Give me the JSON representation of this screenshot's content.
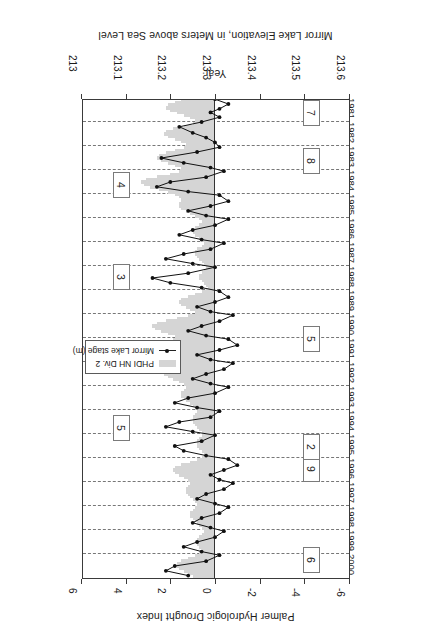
{
  "chart_data": {
    "type": "bar",
    "title": "",
    "orientation": "horizontal-time",
    "xlabel": "Palmer Hydrologic Drought Index",
    "ylabel": "Year",
    "secondary_xlabel": "Mirror Lake Elevation, in Meters above Sea Level",
    "xlim": [
      -6,
      6
    ],
    "xticks": [
      "6",
      "4",
      "2",
      "0",
      "-2",
      "-4",
      "-6"
    ],
    "xtick_values": [
      6,
      4,
      2,
      0,
      -2,
      -4,
      -6
    ],
    "secondary_xlim": [
      213.6,
      213.0
    ],
    "secondary_xticks": [
      "213.6",
      "213.5",
      "213.4",
      "213.3",
      "213.2",
      "213.1",
      "213"
    ],
    "secondary_xtick_values": [
      213.6,
      213.5,
      213.4,
      213.3,
      213.2,
      213.1,
      213.0
    ],
    "ylim": [
      1981,
      2000
    ],
    "yticks": [
      "1981",
      "1982",
      "1983",
      "1984",
      "1985",
      "1986",
      "1987",
      "1988",
      "1989",
      "1990",
      "1991",
      "1992",
      "1993",
      "1994",
      "1995",
      "1996",
      "1997",
      "1998",
      "1999",
      "2000"
    ],
    "grid": true,
    "legend_position": "center-left",
    "legend": [
      {
        "name": "PHDI NH Div. 2",
        "marker": "bar",
        "color": "#d5d5d5"
      },
      {
        "name": "Mirror Lake stage (m)",
        "marker": "line-dot",
        "color": "#111111"
      }
    ],
    "series": [
      {
        "name": "PHDI NH Div. 2",
        "type": "bar",
        "color": "#d5d5d5",
        "x": [
          1981.0,
          1981.1,
          1981.2,
          1981.3,
          1981.4,
          1981.5,
          1981.6,
          1981.7,
          1981.8,
          1981.9,
          1982.0,
          1982.1,
          1982.2,
          1982.3,
          1982.4,
          1982.5,
          1982.6,
          1982.7,
          1982.8,
          1982.9,
          1983.0,
          1983.1,
          1983.2,
          1983.3,
          1983.4,
          1983.5,
          1983.6,
          1983.7,
          1983.8,
          1983.9,
          1984.0,
          1984.1,
          1984.2,
          1984.3,
          1984.4,
          1984.5,
          1984.6,
          1984.7,
          1984.8,
          1984.9,
          1985.0,
          1985.1,
          1985.2,
          1985.3,
          1985.4,
          1985.5,
          1985.6,
          1985.7,
          1985.8,
          1985.9,
          1986.0,
          1986.1,
          1986.2,
          1986.3,
          1986.4,
          1986.5,
          1986.6,
          1986.7,
          1986.8,
          1986.9,
          1987.0,
          1987.1,
          1987.2,
          1987.3,
          1987.4,
          1987.5,
          1987.6,
          1987.7,
          1987.8,
          1987.9,
          1988.0,
          1988.1,
          1988.2,
          1988.3,
          1988.4,
          1988.5,
          1988.6,
          1988.7,
          1988.8,
          1988.9,
          1989.0,
          1989.1,
          1989.2,
          1989.3,
          1989.4,
          1989.5,
          1989.6,
          1989.7,
          1989.8,
          1989.9,
          1990.0,
          1990.1,
          1990.2,
          1990.3,
          1990.4,
          1990.5,
          1990.6,
          1990.7,
          1990.8,
          1990.9,
          1991.0,
          1991.1,
          1991.2,
          1991.3,
          1991.4,
          1991.5,
          1991.6,
          1991.7,
          1991.8,
          1991.9,
          1992.0,
          1992.1,
          1992.2,
          1992.3,
          1992.4,
          1992.5,
          1992.6,
          1992.7,
          1992.8,
          1992.9,
          1993.0,
          1993.1,
          1993.2,
          1993.3,
          1993.4,
          1993.5,
          1993.6,
          1993.7,
          1993.8,
          1993.9,
          1994.0,
          1994.1,
          1994.2,
          1994.3,
          1994.4,
          1994.5,
          1994.6,
          1994.7,
          1994.8,
          1994.9,
          1995.0,
          1995.1,
          1995.2,
          1995.3,
          1995.4,
          1995.5,
          1995.6,
          1995.7,
          1995.8,
          1995.9,
          1996.0,
          1996.1,
          1996.2,
          1996.3,
          1996.4,
          1996.5,
          1996.6,
          1996.7,
          1996.8,
          1996.9,
          1997.0,
          1997.1,
          1997.2,
          1997.3,
          1997.4,
          1997.5,
          1997.6,
          1997.7,
          1997.8,
          1997.9,
          1998.0,
          1998.1,
          1998.2,
          1998.3,
          1998.4,
          1998.5,
          1998.6,
          1998.7,
          1998.8,
          1998.9,
          1999.0,
          1999.1,
          1999.2,
          1999.3,
          1999.4,
          1999.5,
          1999.6,
          1999.7,
          1999.8,
          1999.9,
          2000.0,
          2000.1,
          2000.2,
          2000.3,
          2000.4,
          2000.5,
          2000.6,
          2000.7,
          2000.8,
          2000.9
        ],
        "values": [
          1.3,
          1.5,
          1.8,
          2.1,
          2.2,
          2.0,
          1.7,
          1.4,
          1.1,
          0.9,
          0.8,
          1.0,
          1.4,
          1.9,
          2.2,
          2.3,
          2.1,
          1.8,
          1.5,
          1.3,
          1.2,
          1.4,
          1.8,
          2.2,
          2.5,
          2.6,
          2.4,
          2.1,
          1.8,
          1.5,
          1.4,
          1.6,
          2.0,
          2.6,
          3.1,
          3.3,
          3.2,
          2.9,
          2.5,
          2.1,
          1.8,
          1.6,
          1.5,
          1.5,
          1.6,
          1.6,
          1.5,
          1.3,
          1.1,
          0.9,
          0.7,
          0.6,
          0.6,
          0.7,
          0.9,
          1.0,
          1.0,
          0.9,
          0.7,
          0.6,
          0.5,
          0.5,
          0.6,
          0.8,
          0.9,
          0.9,
          0.8,
          0.7,
          0.6,
          0.5,
          0.4,
          0.4,
          0.5,
          0.6,
          0.7,
          0.7,
          0.6,
          0.5,
          0.4,
          0.3,
          0.4,
          0.6,
          0.9,
          1.2,
          1.5,
          1.6,
          1.5,
          1.3,
          1.1,
          0.9,
          0.9,
          1.2,
          1.7,
          2.2,
          2.6,
          2.8,
          2.7,
          2.4,
          2.1,
          1.8,
          1.7,
          1.9,
          2.3,
          2.7,
          3.0,
          3.0,
          2.8,
          2.5,
          2.2,
          1.9,
          1.8,
          1.9,
          2.1,
          2.3,
          2.4,
          2.3,
          2.1,
          1.9,
          1.6,
          1.4,
          1.3,
          1.3,
          1.4,
          1.5,
          1.5,
          1.4,
          1.3,
          1.1,
          1.0,
          0.9,
          0.8,
          0.8,
          0.9,
          1.0,
          1.0,
          1.0,
          0.9,
          0.8,
          0.7,
          0.6,
          0.6,
          0.6,
          0.7,
          0.8,
          0.8,
          0.8,
          0.7,
          0.6,
          0.5,
          0.5,
          0.6,
          0.8,
          1.1,
          1.5,
          1.8,
          1.9,
          1.8,
          1.6,
          1.4,
          1.2,
          1.1,
          1.1,
          1.2,
          1.3,
          1.3,
          1.2,
          1.1,
          1.0,
          0.9,
          0.8,
          0.8,
          0.9,
          1.0,
          1.1,
          1.1,
          1.0,
          0.9,
          0.8,
          0.7,
          0.6,
          0.5,
          0.5,
          0.6,
          0.7,
          0.8,
          0.8,
          0.8,
          0.7,
          0.6,
          0.6,
          0.7,
          0.9,
          1.2,
          1.5,
          1.7,
          1.7,
          1.6,
          1.4,
          1.2,
          1.0
        ]
      },
      {
        "name": "Mirror Lake stage (m)",
        "type": "line",
        "color": "#111111",
        "marker": "filled-circle",
        "x": [
          1981.05,
          1981.25,
          1981.45,
          1981.6,
          1981.8,
          1982.0,
          1982.2,
          1982.45,
          1982.65,
          1982.85,
          1983.05,
          1983.25,
          1983.5,
          1983.7,
          1983.9,
          1984.05,
          1984.3,
          1984.5,
          1984.7,
          1984.9,
          1985.05,
          1985.3,
          1985.5,
          1985.7,
          1985.9,
          1986.05,
          1986.3,
          1986.5,
          1986.7,
          1986.9,
          1987.05,
          1987.3,
          1987.5,
          1987.7,
          1987.9,
          1988.05,
          1988.3,
          1988.5,
          1988.7,
          1988.9,
          1989.05,
          1989.3,
          1989.5,
          1989.7,
          1989.9,
          1990.05,
          1990.3,
          1990.5,
          1990.7,
          1990.9,
          1991.05,
          1991.3,
          1991.5,
          1991.7,
          1991.9,
          1992.05,
          1992.3,
          1992.5,
          1992.7,
          1992.9,
          1993.05,
          1993.3,
          1993.5,
          1993.7,
          1993.9,
          1994.05,
          1994.3,
          1994.5,
          1994.7,
          1994.9,
          1995.05,
          1995.3,
          1995.5,
          1995.7,
          1995.9,
          1996.05,
          1996.3,
          1996.5,
          1996.7,
          1996.9,
          1997.05,
          1997.3,
          1997.5,
          1997.7,
          1997.9,
          1998.05,
          1998.3,
          1998.5,
          1998.7,
          1998.9,
          1999.05,
          1999.3,
          1999.5,
          1999.7,
          1999.9,
          2000.05,
          2000.3,
          2000.5,
          2000.7,
          2000.9
        ],
        "values_m": [
          213.3,
          213.33,
          213.31,
          213.29,
          213.31,
          213.27,
          213.22,
          213.25,
          213.28,
          213.3,
          213.31,
          213.26,
          213.18,
          213.23,
          213.29,
          213.32,
          213.28,
          213.2,
          213.17,
          213.24,
          213.31,
          213.33,
          213.29,
          213.24,
          213.28,
          213.33,
          213.3,
          213.25,
          213.22,
          213.27,
          213.32,
          213.29,
          213.23,
          213.19,
          213.25,
          213.3,
          213.24,
          213.16,
          213.2,
          213.27,
          213.31,
          213.33,
          213.3,
          213.26,
          213.29,
          213.34,
          213.31,
          213.27,
          213.24,
          213.28,
          213.33,
          213.35,
          213.31,
          213.26,
          213.29,
          213.34,
          213.32,
          213.28,
          213.25,
          213.29,
          213.33,
          213.3,
          213.24,
          213.21,
          213.26,
          213.31,
          213.29,
          213.22,
          213.19,
          213.25,
          213.3,
          213.27,
          213.21,
          213.23,
          213.28,
          213.33,
          213.35,
          213.32,
          213.29,
          213.31,
          213.34,
          213.32,
          213.28,
          213.26,
          213.3,
          213.33,
          213.31,
          213.27,
          213.25,
          213.29,
          213.32,
          213.3,
          213.26,
          213.23,
          213.27,
          213.31,
          213.28,
          213.21,
          213.19,
          213.24
        ]
      }
    ],
    "annotations": [
      {
        "label": "6",
        "side": "left",
        "year": 2000.2
      },
      {
        "label": "9",
        "side": "left",
        "year": 1996.4
      },
      {
        "label": "2",
        "side": "left",
        "year": 1995.5
      },
      {
        "label": "5",
        "side": "left",
        "year": 1991.0
      },
      {
        "label": "8",
        "side": "left",
        "year": 1983.6
      },
      {
        "label": "7",
        "side": "left",
        "year": 1981.6
      },
      {
        "label": "5",
        "side": "right",
        "year": 1994.7
      },
      {
        "label": "3",
        "side": "right",
        "year": 1988.4
      },
      {
        "label": "4",
        "side": "right",
        "year": 1984.6
      }
    ]
  },
  "axes": {
    "phdi_title": "Palmer Hydrologic Drought Index",
    "elevation_title": "Mirror Lake Elevation, in Meters above Sea Level",
    "year_title": "Year"
  },
  "legend": {
    "phdi_label": "PHDI NH Div. 2",
    "stage_label": "Mirror Lake stage (m)"
  }
}
